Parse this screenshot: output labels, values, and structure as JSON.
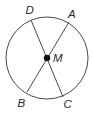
{
  "diagram": {
    "type": "circle-with-diameters",
    "colors": {
      "stroke": "#4a4a4a",
      "center_point": "#111111",
      "label": "#2b2b2b",
      "background": "#ffffff"
    },
    "circle": {
      "center": {
        "x": 47,
        "y": 58
      },
      "radius": 41
    },
    "center_point": {
      "name": "M",
      "label": "M",
      "x": 47,
      "y": 58
    },
    "points": [
      {
        "name": "D",
        "label": "D",
        "x": 31,
        "y": 20,
        "label_x": 25.5,
        "label_y": 14
      },
      {
        "name": "A",
        "label": "A",
        "x": 69,
        "y": 22,
        "label_x": 68,
        "label_y": 18
      },
      {
        "name": "B",
        "label": "B",
        "x": 27,
        "y": 92,
        "label_x": 17.5,
        "label_y": 107
      },
      {
        "name": "C",
        "label": "C",
        "x": 63,
        "y": 97,
        "label_x": 63.5,
        "label_y": 108
      }
    ],
    "segments": [
      {
        "name": "DC",
        "from": "D",
        "to": "C"
      },
      {
        "name": "AB",
        "from": "A",
        "to": "B"
      }
    ]
  }
}
